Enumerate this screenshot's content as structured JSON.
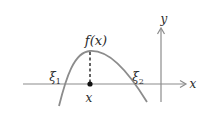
{
  "diagram": {
    "function_label": "f(x)",
    "root_left": {
      "symbol": "ξ",
      "subscript": "1"
    },
    "root_right": {
      "symbol": "ξ",
      "subscript": "2"
    },
    "point_label": "x",
    "x_axis_label": "x",
    "y_axis_label": "y",
    "colors": {
      "curve": "#8c8c8c",
      "axis": "#8c8c8c",
      "dashed": "#222222",
      "point": "#111111",
      "text": "#2a2a2a"
    }
  }
}
